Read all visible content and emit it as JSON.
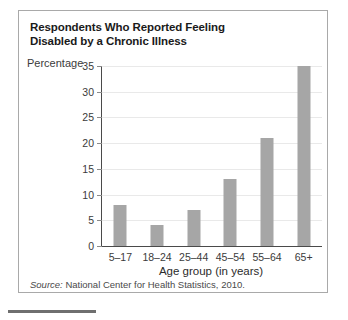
{
  "figure": {
    "title_line_1": "Respondents Who Reported Feeling",
    "title_line_2": "Disabled by a Chronic Illness",
    "source_label": "Source:",
    "source_text": " National Center for Health Statistics, 2010."
  },
  "chart_data": {
    "type": "bar",
    "title": "Respondents Who Reported Feeling Disabled by a Chronic Illness",
    "subtitle": "",
    "xlabel": "Age group (in years)",
    "ylabel": "Percentage",
    "categories": [
      "5–17",
      "18–24",
      "25–44",
      "45–54",
      "55–64",
      "65+"
    ],
    "values": [
      8,
      4,
      7,
      13,
      21,
      35
    ],
    "ylim": [
      0,
      35
    ],
    "yticks": [
      0,
      5,
      10,
      15,
      20,
      25,
      30,
      35
    ],
    "ytick_labels": [
      "0",
      "5",
      "10",
      "15",
      "20",
      "25",
      "30",
      "35"
    ],
    "grid": "horizontal",
    "legend": "none",
    "bar_color": "#a6a6a6",
    "annotations": [
      "Source: National Center for Health Statistics, 2010."
    ]
  }
}
